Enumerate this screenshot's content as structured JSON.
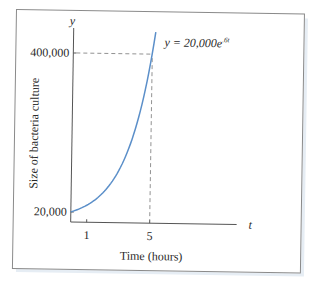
{
  "chart_data": {
    "type": "line",
    "title": "",
    "equation_label": "y = 20,000e",
    "equation_exponent": ".6t",
    "xlabel": "Time (hours)",
    "ylabel": "Size of bacteria culture",
    "x_axis_var": "t",
    "y_axis_var": "y",
    "x_ticks": [
      "1",
      "5"
    ],
    "y_ticks": [
      "20,000",
      "400,000"
    ],
    "series": [
      {
        "name": "y = 20,000e^.6t",
        "x": [
          0,
          0.5,
          1,
          1.5,
          2,
          2.5,
          3,
          3.5,
          4,
          4.5,
          5,
          5.2
        ],
        "values": [
          20000,
          26997,
          36442,
          49192,
          66402,
          89634,
          120993,
          163323,
          220464,
          297597,
          401711,
          453858
        ]
      }
    ],
    "annotations": [
      {
        "type": "dashed-hline",
        "y": 400000,
        "label": "400,000"
      },
      {
        "type": "dashed-vline",
        "x": 5,
        "label": "5"
      }
    ],
    "xlim": [
      0,
      10.5
    ],
    "ylim": [
      0,
      440000
    ],
    "grid": false,
    "line_color": "#5b8fc9"
  }
}
